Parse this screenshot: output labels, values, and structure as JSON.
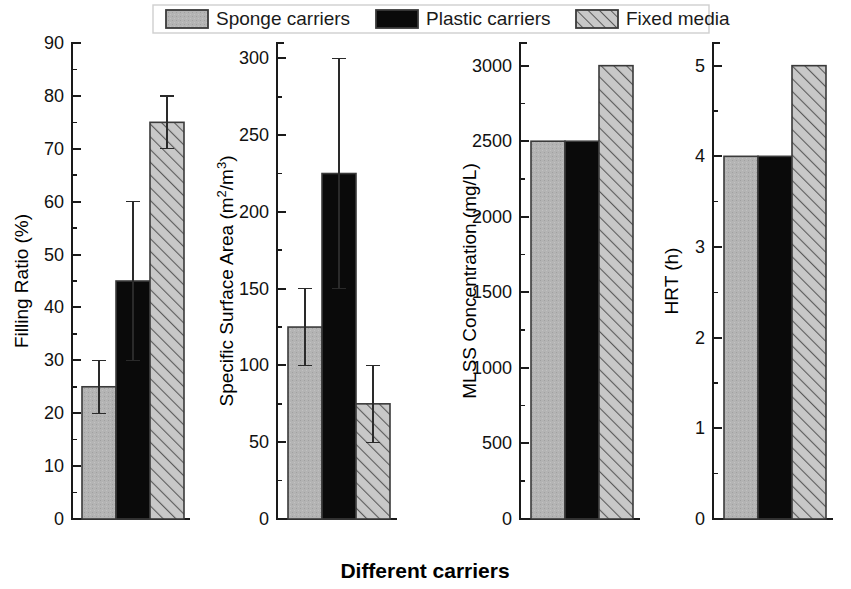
{
  "figure": {
    "xlabel": "Different carriers",
    "background": "#ffffff"
  },
  "legend": {
    "items": [
      {
        "label": "Sponge carriers",
        "fill": "#b4b4b4",
        "style": "solid-gray"
      },
      {
        "label": "Plastic carriers",
        "fill": "#0a0a0a",
        "style": "solid-black"
      },
      {
        "label": "Fixed media",
        "fill": "#c8c8c8",
        "style": "hatched"
      }
    ]
  },
  "chart_data": [
    {
      "type": "bar",
      "title": "",
      "ylabel": "Filling Ratio (%)",
      "xlabel": "",
      "categories": [
        "Sponge carriers",
        "Plastic carriers",
        "Fixed media"
      ],
      "values": [
        25,
        45,
        75
      ],
      "errors_low": [
        20,
        30,
        70
      ],
      "errors_high": [
        30,
        60,
        80
      ],
      "ylim": [
        0,
        90
      ],
      "ytick_step": 10,
      "yminor_step": 5,
      "yticks": [
        0,
        10,
        20,
        30,
        40,
        50,
        60,
        70,
        80,
        90
      ],
      "ytick_labels": [
        "0",
        "10",
        "20",
        "30",
        "40",
        "50",
        "60",
        "70",
        "80",
        "90"
      ],
      "grid": false,
      "legend_position": "top-outside"
    },
    {
      "type": "bar",
      "title": "",
      "ylabel": "Specific Surface Area (m2/m3)",
      "ylabel_parts": [
        "Specific Surface Area (m",
        "2",
        "/m",
        "3",
        ")"
      ],
      "xlabel": "",
      "categories": [
        "Sponge carriers",
        "Plastic carriers",
        "Fixed media"
      ],
      "values": [
        125,
        225,
        75
      ],
      "errors_low": [
        100,
        150,
        50
      ],
      "errors_high": [
        150,
        300,
        100
      ],
      "ylim": [
        0,
        310
      ],
      "ytick_step": 50,
      "yminor_step": 25,
      "yticks": [
        0,
        50,
        100,
        150,
        200,
        250,
        300
      ],
      "ytick_labels": [
        "0",
        "50",
        "100",
        "150",
        "200",
        "250",
        "300"
      ],
      "grid": false,
      "legend_position": "top-outside"
    },
    {
      "type": "bar",
      "title": "",
      "ylabel": "MLSS Concentration (mg/L)",
      "xlabel": "",
      "categories": [
        "Sponge carriers",
        "Plastic carriers",
        "Fixed media"
      ],
      "values": [
        2500,
        2500,
        3000
      ],
      "errors_low": [
        null,
        null,
        null
      ],
      "errors_high": [
        null,
        null,
        null
      ],
      "ylim": [
        0,
        3150
      ],
      "ytick_step": 500,
      "yminor_step": 250,
      "yticks": [
        0,
        500,
        1000,
        1500,
        2000,
        2500,
        3000
      ],
      "ytick_labels": [
        "0",
        "500",
        "1000",
        "1500",
        "2000",
        "2500",
        "3000"
      ],
      "grid": false,
      "legend_position": "top-outside"
    },
    {
      "type": "bar",
      "title": "",
      "ylabel": "HRT (h)",
      "xlabel": "",
      "categories": [
        "Sponge carriers",
        "Plastic carriers",
        "Fixed media"
      ],
      "values": [
        4,
        4,
        5
      ],
      "errors_low": [
        null,
        null,
        null
      ],
      "errors_high": [
        null,
        null,
        null
      ],
      "ylim": [
        0,
        5.25
      ],
      "ytick_step": 1,
      "yminor_step": 0.5,
      "yticks": [
        0,
        1,
        2,
        3,
        4,
        5
      ],
      "ytick_labels": [
        "0",
        "1",
        "2",
        "3",
        "4",
        "5"
      ],
      "grid": false,
      "legend_position": "top-outside"
    }
  ]
}
